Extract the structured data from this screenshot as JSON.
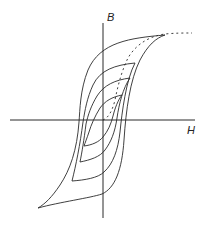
{
  "diagram": {
    "type": "hysteresis-loops",
    "axes": {
      "x_label": "H",
      "y_label": "B"
    },
    "loops": [
      {
        "name": "outer-loop",
        "tip_top": [
          165,
          35
        ],
        "tip_bottom": [
          38,
          208
        ]
      },
      {
        "name": "loop-2",
        "tip_top": [
          135,
          63
        ],
        "tip_bottom": [
          72,
          181
        ]
      },
      {
        "name": "loop-3",
        "tip_top": [
          130,
          78
        ],
        "tip_bottom": [
          80,
          162
        ]
      },
      {
        "name": "inner-loop",
        "tip_top": [
          122,
          95
        ],
        "tip_bottom": [
          84,
          146
        ]
      }
    ],
    "initial_magnetization_curve": "dashed",
    "colors": {
      "line": "#2a2a2a",
      "background": "#ffffff"
    }
  }
}
